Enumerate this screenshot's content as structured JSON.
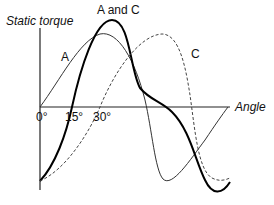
{
  "diagram": {
    "y_axis_label": "Static torque",
    "x_axis_label": "Angle",
    "ticks": [
      {
        "label": "0°",
        "x": 40
      },
      {
        "label": "15°",
        "x": 72
      },
      {
        "label": "30°",
        "x": 101
      }
    ],
    "curve_labels": {
      "a": "A",
      "a_and_c": "A and C",
      "c": "C"
    },
    "curves": [
      {
        "name": "A",
        "style": "thin solid",
        "color": "#333333"
      },
      {
        "name": "A and C",
        "style": "thick solid",
        "color": "#000000"
      },
      {
        "name": "C",
        "style": "dashed",
        "color": "#444444"
      }
    ]
  }
}
